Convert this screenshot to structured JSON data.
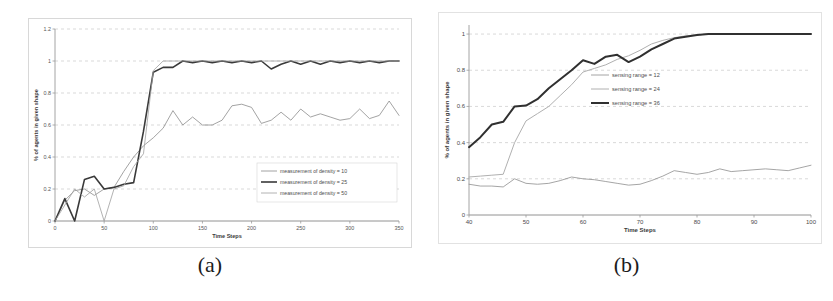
{
  "figure": {
    "panels": [
      {
        "caption": "(a)"
      },
      {
        "caption": "(b)"
      }
    ]
  },
  "chart_data": [
    {
      "panel": "a",
      "type": "line",
      "title": "",
      "xlabel": "Time Steps",
      "ylabel": "% of agents in given shape",
      "xlim": [
        0,
        350
      ],
      "ylim": [
        0,
        1.2
      ],
      "xticks": [
        0,
        50,
        100,
        150,
        200,
        250,
        300,
        350
      ],
      "xtick_labels": [
        "0",
        "50",
        "100",
        "150",
        "200",
        "250",
        "300",
        "350"
      ],
      "yticks": [
        0,
        0.2,
        0.4,
        0.6,
        0.8,
        1,
        1.2
      ],
      "ytick_labels": [
        "0",
        "0.2",
        "0.4",
        "0.6",
        "0.8",
        "1",
        "1.2"
      ],
      "grid": true,
      "legend_position": "center-right",
      "series": [
        {
          "name": "measurement of density = 10",
          "color": "#8c8c8c",
          "width": 0.8,
          "x": [
            0,
            10,
            20,
            30,
            40,
            50,
            60,
            70,
            80,
            90,
            100,
            110,
            120,
            130,
            140,
            150,
            160,
            170,
            180,
            190,
            200,
            210,
            220,
            230,
            240,
            250,
            260,
            270,
            280,
            290,
            300,
            310,
            320,
            330,
            340,
            350
          ],
          "values": [
            0.0,
            0.13,
            0.19,
            0.2,
            0.16,
            0.2,
            0.21,
            0.31,
            0.4,
            0.47,
            0.52,
            0.58,
            0.69,
            0.6,
            0.65,
            0.6,
            0.6,
            0.63,
            0.72,
            0.73,
            0.71,
            0.61,
            0.63,
            0.68,
            0.63,
            0.7,
            0.65,
            0.67,
            0.65,
            0.63,
            0.64,
            0.7,
            0.64,
            0.66,
            0.75,
            0.66
          ]
        },
        {
          "name": "measurement of density = 25",
          "color": "#3a3a3a",
          "width": 1.6,
          "x": [
            0,
            10,
            20,
            30,
            40,
            50,
            60,
            70,
            80,
            90,
            100,
            110,
            120,
            130,
            140,
            150,
            160,
            170,
            180,
            190,
            200,
            210,
            220,
            230,
            240,
            250,
            260,
            270,
            280,
            290,
            300,
            310,
            320,
            330,
            340,
            350
          ],
          "values": [
            0.0,
            0.14,
            0.0,
            0.26,
            0.28,
            0.2,
            0.21,
            0.23,
            0.24,
            0.56,
            0.93,
            0.96,
            0.96,
            1.0,
            0.99,
            1.0,
            0.99,
            1.0,
            0.99,
            1.0,
            0.99,
            1.0,
            0.95,
            0.98,
            1.0,
            0.98,
            1.0,
            0.98,
            1.0,
            0.99,
            1.0,
            0.99,
            1.0,
            0.99,
            1.0,
            1.0
          ]
        },
        {
          "name": "measurement of density = 50",
          "color": "#a0a0a0",
          "width": 0.8,
          "x": [
            0,
            10,
            20,
            30,
            40,
            50,
            60,
            70,
            80,
            90,
            100,
            110,
            120,
            130,
            140,
            150,
            160,
            170,
            180,
            190,
            200,
            210,
            220,
            230,
            240,
            250,
            260,
            270,
            280,
            290,
            300,
            310,
            320,
            330,
            340,
            350
          ],
          "values": [
            0.0,
            0.1,
            0.2,
            0.15,
            0.2,
            0.0,
            0.2,
            0.22,
            0.34,
            0.42,
            0.94,
            1.0,
            1.0,
            1.0,
            1.0,
            1.0,
            1.0,
            1.0,
            1.0,
            1.0,
            1.0,
            1.0,
            1.0,
            1.0,
            1.0,
            1.0,
            1.0,
            1.0,
            1.0,
            1.0,
            1.0,
            1.0,
            1.0,
            1.0,
            1.0,
            1.0
          ]
        }
      ]
    },
    {
      "panel": "b",
      "type": "line",
      "title": "",
      "xlabel": "Time Steps",
      "ylabel": "% of agents in given shape",
      "xlim": [
        40,
        100
      ],
      "ylim": [
        0,
        1.05
      ],
      "xticks": [
        40,
        50,
        60,
        70,
        80,
        90,
        100
      ],
      "xtick_labels": [
        "40",
        "50",
        "60",
        "70",
        "80",
        "90",
        "100"
      ],
      "yticks": [
        0,
        0.2,
        0.4,
        0.6,
        0.8,
        1
      ],
      "ytick_labels": [
        "0",
        "0.2",
        "0.4",
        "0.6",
        "0.8",
        "1"
      ],
      "grid": true,
      "legend_position": "center",
      "series": [
        {
          "name": "sensing range = 12",
          "color": "#8e8e8e",
          "width": 0.8,
          "x": [
            40,
            42,
            44,
            46,
            48,
            50,
            52,
            54,
            56,
            58,
            60,
            62,
            64,
            66,
            68,
            70,
            72,
            74,
            76,
            78,
            80,
            82,
            84,
            86,
            88,
            90,
            92,
            94,
            96,
            98,
            100
          ],
          "values": [
            0.17,
            0.16,
            0.16,
            0.155,
            0.2,
            0.175,
            0.17,
            0.175,
            0.19,
            0.21,
            0.2,
            0.195,
            0.185,
            0.175,
            0.165,
            0.17,
            0.19,
            0.215,
            0.245,
            0.235,
            0.225,
            0.235,
            0.255,
            0.24,
            0.245,
            0.25,
            0.255,
            0.25,
            0.245,
            0.26,
            0.275
          ]
        },
        {
          "name": "sensing range = 24",
          "color": "#b0b0b0",
          "width": 1.0,
          "x": [
            40,
            42,
            44,
            46,
            48,
            50,
            52,
            54,
            56,
            58,
            60,
            62,
            64,
            66,
            68,
            70,
            72,
            74,
            76,
            78,
            80,
            82,
            84,
            86,
            88,
            90,
            92,
            94,
            96,
            98,
            100
          ],
          "values": [
            0.21,
            0.215,
            0.22,
            0.225,
            0.4,
            0.52,
            0.56,
            0.6,
            0.66,
            0.72,
            0.79,
            0.81,
            0.83,
            0.86,
            0.88,
            0.91,
            0.945,
            0.965,
            0.98,
            0.99,
            0.995,
            1.0,
            1.0,
            1.0,
            1.0,
            1.0,
            1.0,
            1.0,
            1.0,
            1.0,
            1.0
          ]
        },
        {
          "name": "sensing range = 36",
          "color": "#303030",
          "width": 2.0,
          "x": [
            40,
            42,
            44,
            46,
            48,
            50,
            52,
            54,
            56,
            58,
            60,
            62,
            64,
            66,
            68,
            70,
            72,
            74,
            76,
            78,
            80,
            82,
            84,
            86,
            88,
            90,
            92,
            94,
            96,
            98,
            100
          ],
          "values": [
            0.375,
            0.43,
            0.5,
            0.515,
            0.6,
            0.605,
            0.64,
            0.7,
            0.75,
            0.8,
            0.855,
            0.835,
            0.875,
            0.885,
            0.845,
            0.875,
            0.915,
            0.945,
            0.975,
            0.985,
            0.995,
            1.0,
            1.0,
            1.0,
            1.0,
            1.0,
            1.0,
            1.0,
            1.0,
            1.0,
            1.0
          ]
        }
      ]
    }
  ]
}
